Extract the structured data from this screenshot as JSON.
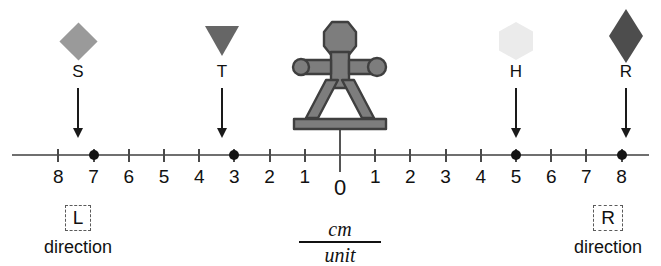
{
  "diagram": {
    "axis": {
      "type": "number-line",
      "center_label": "0",
      "left_tick_labels": [
        "8",
        "7",
        "6",
        "5",
        "4",
        "3",
        "2",
        "1"
      ],
      "right_tick_labels": [
        "1",
        "2",
        "3",
        "4",
        "5",
        "6",
        "7",
        "8"
      ],
      "unit_numerator": "cm",
      "unit_denominator": "unit"
    },
    "direction_left": {
      "box_label": "L",
      "word": "direction"
    },
    "direction_right": {
      "box_label": "R",
      "word": "direction"
    },
    "figure": {
      "name": "stick-figure-person",
      "color": "#7d7d7d",
      "position_value": 0
    },
    "markers": [
      {
        "label": "S",
        "shape": "diamond",
        "color": "#9a9a9a",
        "value": -7,
        "tick_label": "7",
        "side": "left"
      },
      {
        "label": "T",
        "shape": "triangle-down",
        "color": "#666666",
        "value": -3,
        "tick_label": "3",
        "side": "left"
      },
      {
        "label": "H",
        "shape": "hexagon",
        "color": "#ebebeb",
        "value": 5,
        "tick_label": "5",
        "side": "right"
      },
      {
        "label": "R",
        "shape": "rhombus",
        "color": "#4d4d4d",
        "value": 8,
        "tick_label": "8",
        "side": "right"
      }
    ]
  },
  "chart_data": {
    "type": "scatter",
    "xlabel": "cm / unit",
    "ylabel": "",
    "xlim": [
      -8.5,
      8.5
    ],
    "grid": false,
    "legend": "none",
    "tick_positions": [
      -8,
      -7,
      -6,
      -5,
      -4,
      -3,
      -2,
      -1,
      0,
      1,
      2,
      3,
      4,
      5,
      6,
      7,
      8
    ],
    "tick_text": [
      "8",
      "7",
      "6",
      "5",
      "4",
      "3",
      "2",
      "1",
      "0",
      "1",
      "2",
      "3",
      "4",
      "5",
      "6",
      "7",
      "8"
    ],
    "series": [
      {
        "name": "markers",
        "points": [
          {
            "label": "S",
            "x": -7
          },
          {
            "label": "T",
            "x": -3
          },
          {
            "label": "H",
            "x": 5
          },
          {
            "label": "R",
            "x": 8
          }
        ]
      },
      {
        "name": "observer",
        "points": [
          {
            "label": "person",
            "x": 0
          }
        ]
      }
    ],
    "annotations": [
      {
        "text": "L direction",
        "x": -7
      },
      {
        "text": "R direction",
        "x": 8
      },
      {
        "text": "cm/unit",
        "x": 0
      }
    ]
  }
}
